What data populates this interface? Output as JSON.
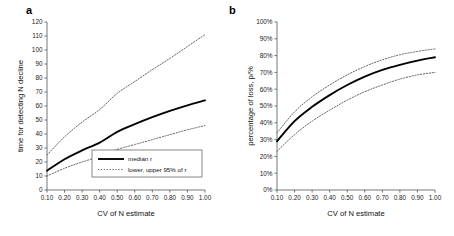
{
  "figure": {
    "panels": [
      {
        "label": "a",
        "xlabel": "CV of N estimate",
        "ylabel": "time for detecting N decline"
      },
      {
        "label": "b",
        "xlabel": "CV of N estimate",
        "ylabel": "percentage of loss, p/%"
      }
    ],
    "legend": {
      "median_label": "median r",
      "ci_label": "lower, upper 95% of r"
    },
    "colors": {
      "median_line": "#000000",
      "ci_line": "#4a4a4a",
      "axis": "#555555",
      "background": "#ffffff"
    }
  },
  "chart_data": [
    {
      "type": "line",
      "title": "a",
      "xlabel": "CV of N estimate",
      "ylabel": "time for detecting N decline",
      "xlim": [
        0.1,
        1.0
      ],
      "ylim": [
        0,
        120
      ],
      "xticks": [
        0.1,
        0.2,
        0.3,
        0.4,
        0.5,
        0.6,
        0.7,
        0.8,
        0.9,
        1.0
      ],
      "xticklabels": [
        "0.10",
        "0.20",
        "0.30",
        "0.40",
        "0.50",
        "0.60",
        "0.70",
        "0.80",
        "0.90",
        "1.00"
      ],
      "yticks": [
        0,
        10,
        20,
        30,
        40,
        50,
        60,
        70,
        80,
        90,
        100,
        110,
        120
      ],
      "yticklabels": [
        "0",
        "10",
        "20",
        "30",
        "40",
        "50",
        "60",
        "70",
        "80",
        "90",
        "100",
        "110",
        "120"
      ],
      "grid": false,
      "legend_position": "lower-right-inside",
      "x": [
        0.1,
        0.2,
        0.3,
        0.4,
        0.5,
        0.6,
        0.7,
        0.8,
        0.9,
        1.0
      ],
      "series": [
        {
          "name": "median r",
          "style": "solid",
          "values": [
            13.8,
            22.0,
            28.3,
            33.8,
            41.5,
            47.0,
            52.0,
            56.5,
            60.5,
            64.0
          ]
        },
        {
          "name": "upper 95% of r",
          "style": "dotted",
          "values": [
            25.0,
            38.0,
            48.5,
            57.5,
            69.0,
            77.5,
            86.0,
            94.0,
            102.5,
            111.0
          ]
        },
        {
          "name": "lower 95% of r",
          "style": "dotted",
          "values": [
            10.0,
            15.5,
            20.0,
            24.0,
            29.0,
            32.5,
            36.0,
            39.5,
            43.0,
            46.0
          ]
        }
      ]
    },
    {
      "type": "line",
      "title": "b",
      "xlabel": "CV of N estimate",
      "ylabel": "percentage of loss, p/%",
      "xlim": [
        0.1,
        1.0
      ],
      "ylim": [
        0,
        100
      ],
      "xticks": [
        0.1,
        0.2,
        0.3,
        0.4,
        0.5,
        0.6,
        0.7,
        0.8,
        0.9,
        1.0
      ],
      "xticklabels": [
        "0.10",
        "0.20",
        "0.30",
        "0.40",
        "0.50",
        "0.60",
        "0.70",
        "0.80",
        "0.90",
        "1.00"
      ],
      "yticks": [
        0,
        10,
        20,
        30,
        40,
        50,
        60,
        70,
        80,
        90,
        100
      ],
      "yticklabels": [
        "0%",
        "10%",
        "20%",
        "30%",
        "40%",
        "50%",
        "60%",
        "70%",
        "80%",
        "90%",
        "100%"
      ],
      "grid": false,
      "legend_position": "none",
      "x": [
        0.1,
        0.2,
        0.3,
        0.4,
        0.5,
        0.6,
        0.7,
        0.8,
        0.9,
        1.0
      ],
      "series": [
        {
          "name": "median r",
          "style": "solid",
          "values": [
            29.0,
            41.0,
            49.5,
            56.5,
            62.5,
            67.5,
            71.5,
            74.5,
            77.0,
            79.0
          ]
        },
        {
          "name": "upper 95% of r",
          "style": "dotted",
          "values": [
            34.0,
            46.5,
            55.5,
            62.5,
            68.5,
            73.5,
            77.5,
            80.5,
            82.5,
            84.0
          ]
        },
        {
          "name": "lower 95% of r",
          "style": "dotted",
          "values": [
            23.0,
            33.0,
            41.0,
            47.5,
            53.5,
            58.5,
            62.5,
            66.0,
            68.5,
            70.0
          ]
        }
      ]
    }
  ]
}
